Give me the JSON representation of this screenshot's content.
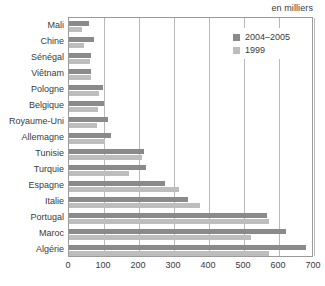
{
  "unit_note": "en milliers",
  "legend": {
    "items": [
      {
        "label": "2004–2005",
        "color": "#8a8a8a"
      },
      {
        "label": "1999",
        "color": "#bdbdbd"
      }
    ]
  },
  "chart_data": {
    "type": "bar",
    "orientation": "horizontal",
    "title": "",
    "subtitle": "en milliers",
    "xlabel": "",
    "ylabel": "",
    "xlim": [
      0,
      700
    ],
    "xticks": [
      0,
      100,
      200,
      300,
      400,
      500,
      600,
      700
    ],
    "xtick_labels": [
      "0",
      "100",
      "200",
      "300",
      "400",
      "500",
      "600",
      "700"
    ],
    "grid": "vertical",
    "legend_position": "top-right",
    "categories": [
      "Mali",
      "Chine",
      "Sénégal",
      "Viêtnam",
      "Pologne",
      "Belgique",
      "Royaume-Uni",
      "Allemagne",
      "Tunisie",
      "Turquie",
      "Espagne",
      "Italie",
      "Portugal",
      "Maroc",
      "Algérie"
    ],
    "series": [
      {
        "name": "2004–2005",
        "color": "#8a8a8a",
        "values": [
          56,
          70,
          62,
          62,
          96,
          100,
          110,
          120,
          215,
          220,
          275,
          340,
          565,
          620,
          677
        ]
      },
      {
        "name": "1999",
        "color": "#bdbdbd",
        "values": [
          38,
          44,
          60,
          62,
          86,
          84,
          80,
          104,
          208,
          172,
          315,
          375,
          572,
          520,
          572
        ]
      }
    ]
  }
}
